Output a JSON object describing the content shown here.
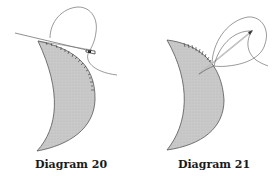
{
  "figures": [
    {
      "id": "diagram-20",
      "caption": "Diagram 20",
      "description": "Crescent-shaped tissue edge with a needle and suture passing along the upper curved edge; stitch marks along the outer edge"
    },
    {
      "id": "diagram-21",
      "caption": "Diagram 21",
      "description": "Crescent-shaped tissue edge with a needle being drawn out through loops of thread; stitch marks along the upper edge"
    }
  ],
  "colors": {
    "fill": "#c8c8c8",
    "stroke": "#444444",
    "thread": "#555555",
    "background": "#ffffff"
  }
}
